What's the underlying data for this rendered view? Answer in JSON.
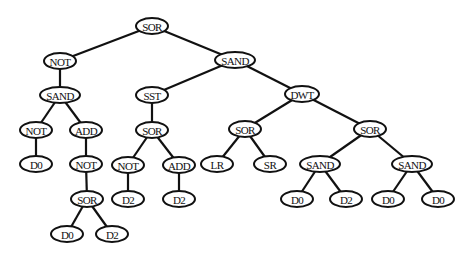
{
  "diagram": {
    "type": "tree",
    "width": 475,
    "height": 258,
    "colors": {
      "line": "#111111",
      "fill": "#ffffff",
      "text": "#111111"
    },
    "nodes": [
      {
        "id": "n0",
        "label": "SOR",
        "x": 152,
        "y": 26,
        "rx": 16,
        "ry": 8
      },
      {
        "id": "n1",
        "label": "NOT",
        "x": 60,
        "y": 61,
        "rx": 16,
        "ry": 8
      },
      {
        "id": "n2",
        "label": "SAND",
        "x": 235,
        "y": 60,
        "rx": 20,
        "ry": 8
      },
      {
        "id": "n3",
        "label": "SAND",
        "x": 60,
        "y": 95,
        "rx": 20,
        "ry": 8
      },
      {
        "id": "n4",
        "label": "NOT",
        "x": 36,
        "y": 130,
        "rx": 16,
        "ry": 8
      },
      {
        "id": "n5",
        "label": "ADD",
        "x": 86,
        "y": 130,
        "rx": 16,
        "ry": 8
      },
      {
        "id": "n6",
        "label": "D0",
        "x": 36,
        "y": 164,
        "rx": 16,
        "ry": 8
      },
      {
        "id": "n7",
        "label": "NOT",
        "x": 86,
        "y": 164,
        "rx": 16,
        "ry": 8
      },
      {
        "id": "n8",
        "label": "SOR",
        "x": 87,
        "y": 199,
        "rx": 16,
        "ry": 8
      },
      {
        "id": "n9",
        "label": "D0",
        "x": 67,
        "y": 234,
        "rx": 16,
        "ry": 8
      },
      {
        "id": "n10",
        "label": "D2",
        "x": 112,
        "y": 234,
        "rx": 16,
        "ry": 8
      },
      {
        "id": "n11",
        "label": "SST",
        "x": 152,
        "y": 95,
        "rx": 16,
        "ry": 8
      },
      {
        "id": "n12",
        "label": "SOR",
        "x": 152,
        "y": 130,
        "rx": 16,
        "ry": 8
      },
      {
        "id": "n13",
        "label": "NOT",
        "x": 128,
        "y": 165,
        "rx": 16,
        "ry": 8
      },
      {
        "id": "n14",
        "label": "ADD",
        "x": 179,
        "y": 165,
        "rx": 16,
        "ry": 8
      },
      {
        "id": "n15",
        "label": "D2",
        "x": 128,
        "y": 199,
        "rx": 16,
        "ry": 8
      },
      {
        "id": "n16",
        "label": "D2",
        "x": 179,
        "y": 199,
        "rx": 16,
        "ry": 8
      },
      {
        "id": "n17",
        "label": "DWT",
        "x": 302,
        "y": 94,
        "rx": 17,
        "ry": 8
      },
      {
        "id": "n18",
        "label": "SOR",
        "x": 245,
        "y": 129,
        "rx": 16,
        "ry": 8
      },
      {
        "id": "n19",
        "label": "LR",
        "x": 217,
        "y": 164,
        "rx": 16,
        "ry": 8
      },
      {
        "id": "n20",
        "label": "SR",
        "x": 270,
        "y": 164,
        "rx": 16,
        "ry": 8
      },
      {
        "id": "n21",
        "label": "SOR",
        "x": 370,
        "y": 129,
        "rx": 16,
        "ry": 8
      },
      {
        "id": "n22",
        "label": "SAND",
        "x": 320,
        "y": 164,
        "rx": 20,
        "ry": 8
      },
      {
        "id": "n23",
        "label": "SAND",
        "x": 412,
        "y": 164,
        "rx": 20,
        "ry": 8
      },
      {
        "id": "n24",
        "label": "D0",
        "x": 297,
        "y": 199,
        "rx": 16,
        "ry": 8
      },
      {
        "id": "n25",
        "label": "D2",
        "x": 346,
        "y": 199,
        "rx": 16,
        "ry": 8
      },
      {
        "id": "n26",
        "label": "D0",
        "x": 388,
        "y": 199,
        "rx": 16,
        "ry": 8
      },
      {
        "id": "n27",
        "label": "D0",
        "x": 438,
        "y": 199,
        "rx": 16,
        "ry": 8
      }
    ],
    "edges": [
      [
        "n0",
        "n1"
      ],
      [
        "n0",
        "n2"
      ],
      [
        "n1",
        "n3"
      ],
      [
        "n3",
        "n4"
      ],
      [
        "n3",
        "n5"
      ],
      [
        "n4",
        "n6"
      ],
      [
        "n5",
        "n7"
      ],
      [
        "n7",
        "n8"
      ],
      [
        "n8",
        "n9"
      ],
      [
        "n8",
        "n10"
      ],
      [
        "n2",
        "n11"
      ],
      [
        "n2",
        "n17"
      ],
      [
        "n11",
        "n12"
      ],
      [
        "n12",
        "n13"
      ],
      [
        "n12",
        "n14"
      ],
      [
        "n13",
        "n15"
      ],
      [
        "n14",
        "n16"
      ],
      [
        "n17",
        "n18"
      ],
      [
        "n17",
        "n21"
      ],
      [
        "n18",
        "n19"
      ],
      [
        "n18",
        "n20"
      ],
      [
        "n21",
        "n22"
      ],
      [
        "n21",
        "n23"
      ],
      [
        "n22",
        "n24"
      ],
      [
        "n22",
        "n25"
      ],
      [
        "n23",
        "n26"
      ],
      [
        "n23",
        "n27"
      ]
    ]
  }
}
